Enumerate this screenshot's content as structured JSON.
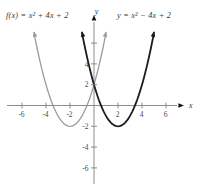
{
  "figure": {
    "background": "#ffffff",
    "axis_color": "#808080",
    "arrow_color": "#111111",
    "tick_label_color": "#4d4d4d"
  },
  "chart_data": {
    "type": "line",
    "title": "",
    "xlabel": "x",
    "ylabel": "y",
    "xlim": [
      -7.3,
      7.7
    ],
    "ylim": [
      -7.8,
      9
    ],
    "grid": false,
    "legend_position": "none",
    "x_ticks": [
      -6,
      -4,
      -2,
      2,
      4,
      6
    ],
    "x_tick_labels": [
      "-6",
      "-4",
      "-2",
      "2",
      "4",
      "6"
    ],
    "y_ticks": [
      6,
      4,
      2,
      -2,
      -4,
      -6
    ],
    "y_tick_labels": [
      "",
      "4",
      "2",
      "-2",
      "-4",
      "-6"
    ],
    "series": [
      {
        "name": "f(x) = x² + 4x + 2",
        "equation": "f(x) = x^2 + 4x + 2",
        "vertex": [
          -2,
          -2
        ],
        "a": 1,
        "domain": [
          -5,
          1
        ],
        "color": "#9b9b9b",
        "stroke_width": 1.3,
        "points": [
          [
            -5,
            7
          ],
          [
            -4,
            2
          ],
          [
            -3,
            -1
          ],
          [
            -2,
            -2
          ],
          [
            -1,
            -1
          ],
          [
            0,
            2
          ],
          [
            1,
            7
          ]
        ]
      },
      {
        "name": "y = x² − 4x + 2",
        "equation": "y = x^2 - 4x + 2",
        "vertex": [
          2,
          -2
        ],
        "a": 1,
        "domain": [
          -1,
          5
        ],
        "color": "#1c1c1c",
        "stroke_width": 1.8,
        "points": [
          [
            -1,
            7
          ],
          [
            0,
            2
          ],
          [
            1,
            -1
          ],
          [
            2,
            -2
          ],
          [
            3,
            -1
          ],
          [
            4,
            2
          ],
          [
            5,
            7
          ]
        ]
      }
    ],
    "annotations": [
      {
        "text": "f(x) = x² + 4x + 2",
        "anchor": "top-left"
      },
      {
        "text": "y = x² − 4x + 2",
        "anchor": "top-right"
      }
    ],
    "layout_hints": {
      "origin_px": [
        94,
        105.5
      ],
      "px_per_unit_x": 12,
      "px_per_unit_y": 10.4,
      "x_axis_extent_px": [
        7,
        177
      ],
      "y_axis_extent_px": [
        22,
        184
      ]
    }
  }
}
